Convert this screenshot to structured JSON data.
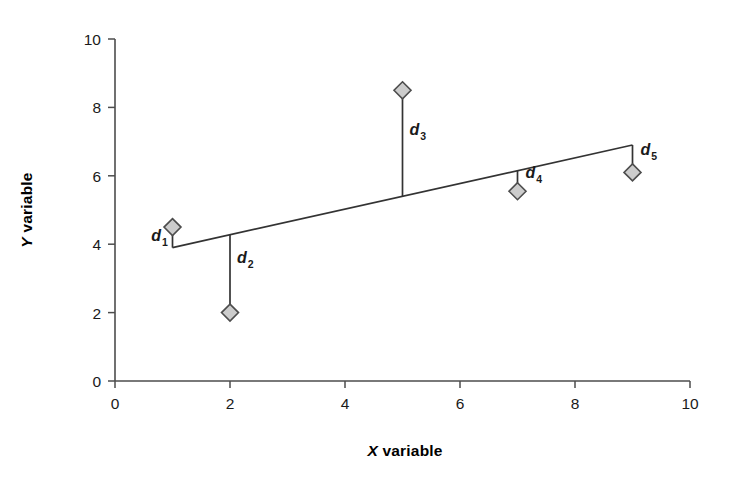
{
  "chart_data": {
    "type": "scatter",
    "title": "",
    "xlabel": "X variable",
    "ylabel": "Y variable",
    "xlim": [
      0,
      10
    ],
    "ylim": [
      0,
      10
    ],
    "xticks": [
      0,
      2,
      4,
      6,
      8,
      10
    ],
    "yticks": [
      0,
      2,
      4,
      6,
      8,
      10
    ],
    "xtick_labels": [
      "0",
      "2",
      "4",
      "6",
      "8",
      "10"
    ],
    "ytick_labels": [
      "0",
      "2",
      "4",
      "6",
      "8",
      "10"
    ],
    "grid": false,
    "legend": "none",
    "series": [
      {
        "name": "data points",
        "marker": "diamond",
        "marker_fill": "#cccccc",
        "marker_edge": "#4d4d4d",
        "x": [
          1,
          2,
          5,
          7,
          9
        ],
        "y": [
          4.5,
          2.0,
          8.5,
          5.55,
          6.1
        ]
      }
    ],
    "fit_line": {
      "name": "regression line",
      "x": [
        1,
        9
      ],
      "y": [
        3.9,
        6.9
      ],
      "color": "#333333"
    },
    "residuals": [
      {
        "label": "d",
        "subscript": "1",
        "x": 1,
        "y_point": 4.5,
        "y_line": 3.9,
        "label_x": 0.92,
        "label_y": 4.08,
        "anchor": "end"
      },
      {
        "label": "d",
        "subscript": "2",
        "x": 2,
        "y_point": 2.0,
        "y_line": 4.27,
        "label_x": 2.12,
        "label_y": 3.45,
        "anchor": "start"
      },
      {
        "label": "d",
        "subscript": "3",
        "x": 5,
        "y_point": 8.5,
        "y_line": 5.4,
        "label_x": 5.12,
        "label_y": 7.2,
        "anchor": "start"
      },
      {
        "label": "d",
        "subscript": "4",
        "x": 7,
        "y_point": 5.55,
        "y_line": 6.15,
        "label_x": 7.14,
        "label_y": 5.95,
        "anchor": "start"
      },
      {
        "label": "d",
        "subscript": "5",
        "x": 9,
        "y_point": 6.1,
        "y_line": 6.9,
        "label_x": 9.14,
        "label_y": 6.62,
        "anchor": "start"
      }
    ],
    "axis_color": "#4d4d4d",
    "text_color": "#1a1a1a"
  },
  "labels": {
    "x_axis_title_letter": "X",
    "x_axis_title_rest": " variable",
    "y_axis_title_letter": "Y",
    "y_axis_title_rest": " variable"
  }
}
